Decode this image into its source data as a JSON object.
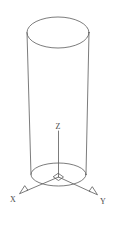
{
  "figure": {
    "type": "line-drawing",
    "background_color": "#ffffff",
    "stroke_color": "#5a5a5a",
    "stroke_width": 0.8,
    "canvas": {
      "width": 114,
      "height": 229
    }
  },
  "labels": {
    "x_axis": "X",
    "y_axis": "Y",
    "z_axis": "Z"
  },
  "geometry": {
    "top_ellipse": {
      "cx": 58,
      "cy": 32.5,
      "rx": 31,
      "ry": 15.5
    },
    "bottom_ellipse": {
      "cx": 58.5,
      "cy": 174.5,
      "rx": 27.5,
      "ry": 11.5
    },
    "left_side_line": {
      "x1": 27,
      "y1": 32.5,
      "x2": 31,
      "y2": 174.5
    },
    "right_side_line": {
      "x1": 89,
      "y1": 32.5,
      "x2": 86,
      "y2": 174.5
    },
    "origin": {
      "x": 58.5,
      "y": 177
    },
    "z_axis_line": {
      "x1": 58.5,
      "y1": 131,
      "x2": 58.5,
      "y2": 177
    },
    "x_axis_line": {
      "x1": 58.5,
      "y1": 177,
      "x2": 26,
      "y2": 191
    },
    "y_axis_line": {
      "x1": 58.5,
      "y1": 177,
      "x2": 91,
      "y2": 192
    },
    "origin_diamond": {
      "cx": 58.5,
      "cy": 177,
      "rx": 5,
      "ry": 3.5
    }
  },
  "label_positions": {
    "x": {
      "x": 13,
      "y": 201
    },
    "y": {
      "x": 101,
      "y": 203
    },
    "z": {
      "x": 55,
      "y": 129
    }
  }
}
